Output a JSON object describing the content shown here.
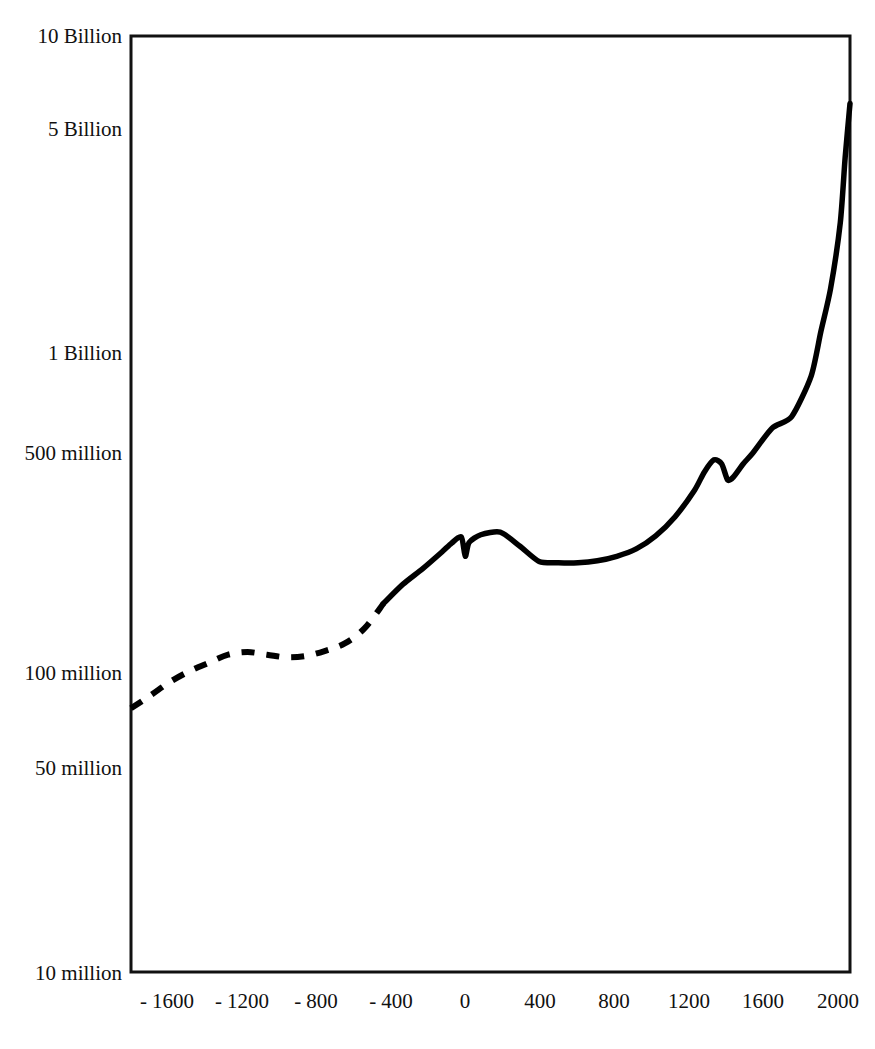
{
  "chart_data": {
    "type": "line",
    "title": "",
    "subtitle": "",
    "xlabel": "",
    "ylabel": "",
    "yscale": "log",
    "xscale": "linear",
    "grid": false,
    "legend": null,
    "xlim": [
      -1700,
      2000
    ],
    "ylim": [
      10000000,
      10000000000
    ],
    "x_tick_values": [
      -1600,
      -1200,
      -800,
      -400,
      0,
      400,
      800,
      1200,
      1600,
      2000
    ],
    "x_tick_labels": [
      "- 1600",
      "- 1200",
      "- 800",
      "- 400",
      "0",
      "400",
      "800",
      "1200",
      "1600",
      "2000"
    ],
    "y_tick_values": [
      10000000,
      50000000,
      100000000,
      500000000,
      1000000000,
      5000000000,
      10000000000
    ],
    "y_tick_labels": [
      "10 million",
      "50 million",
      "100 million",
      "500 million",
      "1 Billion",
      "5 Billion",
      "10 Billion"
    ],
    "series": [
      {
        "name": "World population (estimated)",
        "style": "dashed",
        "color": "#000000",
        "x": [
          -1700,
          -1600,
          -1500,
          -1400,
          -1300,
          -1200,
          -1100,
          -1000,
          -900,
          -800,
          -700,
          -600,
          -500,
          -400
        ],
        "values": [
          70000000,
          77000000,
          85000000,
          92000000,
          98000000,
          104000000,
          106000000,
          104000000,
          102000000,
          103000000,
          107000000,
          113000000,
          126000000,
          152000000
        ]
      },
      {
        "name": "World population (recorded)",
        "style": "solid",
        "color": "#000000",
        "x": [
          -400,
          -300,
          -200,
          -100,
          -50,
          0,
          20,
          40,
          100,
          200,
          300,
          400,
          500,
          600,
          700,
          800,
          900,
          1000,
          1100,
          1200,
          1250,
          1300,
          1340,
          1370,
          1400,
          1450,
          1500,
          1600,
          1700,
          1800,
          1850,
          1900,
          1950,
          1975,
          2000
        ],
        "values": [
          152000000,
          175000000,
          196000000,
          222000000,
          237000000,
          248000000,
          215000000,
          238000000,
          252000000,
          257000000,
          232000000,
          207000000,
          205000000,
          205000000,
          208000000,
          215000000,
          227000000,
          250000000,
          288000000,
          350000000,
          400000000,
          438000000,
          425000000,
          378000000,
          386000000,
          425000000,
          461000000,
          554000000,
          603000000,
          813000000,
          1128000000,
          1550000000,
          2520000000,
          4070000000,
          6080000000
        ]
      }
    ],
    "annotations": [
      {
        "label": "dashed segment = estimated prehistoric population",
        "x_range": [
          -1700,
          -400
        ]
      },
      {
        "label": "sharp dip near year 0",
        "x": 20
      },
      {
        "label": "Black Death dip",
        "x": 1370
      }
    ]
  },
  "axes": {
    "y_ticks": [
      {
        "label": "10 Billion",
        "value": 10000000000
      },
      {
        "label": "5 Billion",
        "value": 5000000000
      },
      {
        "label": "1 Billion",
        "value": 1000000000
      },
      {
        "label": "500 million",
        "value": 500000000
      },
      {
        "label": "100 million",
        "value": 100000000
      },
      {
        "label": "50 million",
        "value": 50000000
      },
      {
        "label": "10 million",
        "value": 10000000
      }
    ],
    "x_ticks": [
      {
        "label": "- 1600",
        "value": -1600
      },
      {
        "label": "- 1200",
        "value": -1200
      },
      {
        "label": "- 800",
        "value": -800
      },
      {
        "label": "- 400",
        "value": -400
      },
      {
        "label": "0",
        "value": 0
      },
      {
        "label": "400",
        "value": 400
      },
      {
        "label": "800",
        "value": 800
      },
      {
        "label": "1200",
        "value": 1200
      },
      {
        "label": "1600",
        "value": 1600
      },
      {
        "label": "2000",
        "value": 2000
      }
    ]
  },
  "colors": {
    "curve": "#000000",
    "frame": "#111111",
    "background": "#ffffff",
    "text": "#111111"
  }
}
